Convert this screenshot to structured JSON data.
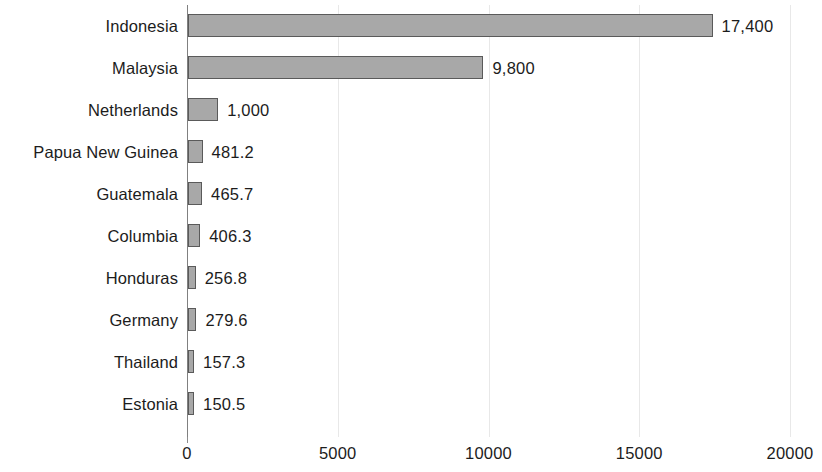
{
  "chart_data": {
    "type": "bar",
    "orientation": "horizontal",
    "title": "",
    "subtitle": "",
    "xlabel": "",
    "ylabel": "",
    "xlim": [
      0,
      20000
    ],
    "ylim": null,
    "grid": true,
    "grid_axis": "x",
    "legend": false,
    "legend_position": "none",
    "categories": [
      "Indonesia",
      "Malaysia",
      "Netherlands",
      "Papua New Guinea",
      "Guatemala",
      "Columbia",
      "Honduras",
      "Germany",
      "Thailand",
      "Estonia"
    ],
    "values": [
      17400,
      9800,
      1000,
      481.2,
      465.7,
      406.3,
      256.8,
      279.6,
      157.3,
      150.5
    ],
    "data_labels": [
      "17,400",
      "9,800",
      "1,000",
      "481.2",
      "465.7",
      "406.3",
      "256.8",
      "279.6",
      "157.3",
      "150.5"
    ],
    "xticks": [
      0,
      5000,
      10000,
      15000,
      20000
    ],
    "xtick_labels": [
      "0",
      "5000",
      "10000",
      "15000",
      "20000"
    ],
    "bar_fill_color": "#a8a8a8",
    "bar_border_color": "#5a5a5a",
    "gridline_color": "#e8e8e8",
    "axis_color": "#808080",
    "text_color": "#1c1c1c",
    "background_color": "#ffffff"
  }
}
